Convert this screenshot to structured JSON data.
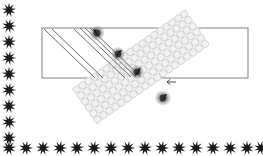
{
  "figure": {
    "canvas": {
      "width": 263,
      "height": 156,
      "background": "#ffffff"
    },
    "colors": {
      "star_fill": "#1a1a1a",
      "rect_stroke": "#8a8a8a",
      "mesh_stroke": "#c9c9c9",
      "mesh_fill": "#f2f2f2",
      "guide_line_stroke": "#5a5a5a",
      "node_dark": "#5e5e5e",
      "node_core": "#2e2e2e",
      "arrow_stroke": "#3a3a3a"
    }
  },
  "border_stars": {
    "name": "decorative-star-border",
    "point_count": 9,
    "outer_radius": 7.2,
    "inner_radius": 2.9,
    "left_column": {
      "x": 9,
      "count": 9,
      "y_values": [
        10,
        26,
        42,
        58,
        74,
        90,
        106,
        122,
        138
      ]
    },
    "bottom_row": {
      "y": 148,
      "count": 16,
      "x_values": [
        9,
        26,
        43,
        60,
        77,
        94,
        111,
        128,
        145,
        162,
        179,
        196,
        213,
        230,
        247,
        261
      ]
    }
  },
  "frame_rectangle": {
    "name": "outer-rectangle-frame",
    "x": 42,
    "y": 28,
    "width": 206,
    "height": 50,
    "stroke_width": 1.1
  },
  "mesh_band": {
    "name": "diagonal-mesh-band",
    "angle_deg": 55,
    "center_x": 139,
    "center_y": 67,
    "length": 142,
    "width": 42,
    "cell_size": 7.3,
    "cell_inset": 1.25,
    "stroke_width": 0.8
  },
  "guide_lines": {
    "name": "diagonal-guide-lines",
    "stroke_width": 0.9,
    "segments": [
      {
        "x1": 44,
        "y1": 29,
        "x2": 95,
        "y2": 78
      },
      {
        "x1": 52,
        "y1": 29,
        "x2": 103,
        "y2": 78
      },
      {
        "x1": 74,
        "y1": 29,
        "x2": 125,
        "y2": 78
      },
      {
        "x1": 80,
        "y1": 28,
        "x2": 131,
        "y2": 77
      },
      {
        "x1": 85,
        "y1": 28,
        "x2": 136,
        "y2": 77
      },
      {
        "x1": 90,
        "y1": 28,
        "x2": 141,
        "y2": 77
      }
    ]
  },
  "nodes": [
    {
      "label": "node-1",
      "cx": 97,
      "cy": 33,
      "rx": 7.5,
      "ry": 7.5,
      "core_r": 3.4,
      "has_arrow": true,
      "arrow_dir": "up-left"
    },
    {
      "label": "node-2",
      "cx": 118,
      "cy": 54,
      "rx": 7.0,
      "ry": 7.0,
      "core_r": 3.2,
      "has_arrow": true,
      "arrow_dir": "up-right"
    },
    {
      "label": "node-3",
      "cx": 137,
      "cy": 72,
      "rx": 7.0,
      "ry": 7.0,
      "core_r": 3.2,
      "has_arrow": true,
      "arrow_dir": "up-right"
    },
    {
      "label": "node-4",
      "cx": 163,
      "cy": 98,
      "rx": 8.0,
      "ry": 7.5,
      "core_r": 3.4,
      "has_arrow": true,
      "arrow_dir": "up-right"
    }
  ],
  "callout_arrow": {
    "name": "left-pointing-callout-arrow",
    "x": 176,
    "y": 82,
    "length": 9,
    "head_size": 3.2,
    "direction": "left"
  }
}
